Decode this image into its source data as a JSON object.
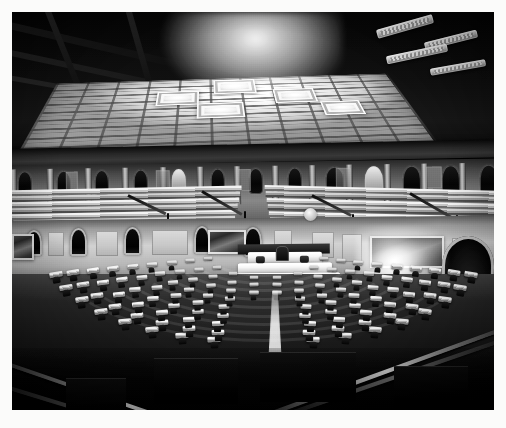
{
  "image": {
    "type": "photograph",
    "medium": "black-and-white gelatin silver print",
    "subject": "Interior of a legislative chamber (United States House of Representatives)",
    "view": "Elevated wide-angle view from the rear gallery looking toward the Speaker's rostrum",
    "orientation": "landscape",
    "border_color": "#fbfbfa",
    "caption": ""
  },
  "palette": {
    "paper_white": "#fbfbfa",
    "highlight": "#ffffff",
    "light_gray": "#d8d8d8",
    "mid_gray": "#8d8d8d",
    "dark_gray": "#3b3b3b",
    "shadow_black": "#080808"
  },
  "regions": {
    "ceiling": {
      "label": "Coffered skylight ceiling",
      "description": "Large rectangular laylight of frosted glass panels divided by a grid of mullions, with stepped recessed coffers and dark structural beams at the upper left",
      "coffer_count": 5,
      "bright_panel_count": 42,
      "tone": "brightest area of the photograph"
    },
    "light_fixtures": {
      "label": "Angled ceiling light fixtures",
      "count": 4,
      "position": "upper right, mounted on the dark ceiling plane"
    },
    "cornice": {
      "label": "Entablature and cornice band",
      "description": "Dark horizontal moulding separating the ceiling from the gallery wall"
    },
    "gallery_wall": {
      "label": "Upper gallery wall",
      "description": "Band of pilasters alternating with arched niches and flat panels running the full width of the chamber",
      "pilaster_count": 14,
      "niche_count": 13
    },
    "galleries": {
      "label": "Public galleries",
      "description": "Tiered stepped bench seating on the left and right, empty, with dark iron stair railings",
      "left_tier_count": 7,
      "right_tier_count": 8,
      "stair_rails": 4
    },
    "main_wall": {
      "label": "Lower chamber wall",
      "description": "Paneled dado with arched doorways and large framed landscape murals",
      "mural_count": 3,
      "arched_doorways": 5
    },
    "large_arch": {
      "label": "Large arched doorway",
      "position": "far right of the chamber wall",
      "tone": "deep black opening framed in white moulding"
    },
    "light_flare": {
      "label": "Lens flare / lamp burst",
      "position": "right wall, above the desks",
      "description": "Blown-out highlight where a light source overexposed the negative"
    },
    "clock": {
      "label": "Wall clock disc",
      "position": "above the rostrum, left of centre"
    },
    "rostrum": {
      "label": "Speaker's rostrum",
      "description": "Tiered white marble dais at the centre of the chamber with the Speaker's chair and clerks' desks",
      "tiers": 3,
      "chair": "Speaker's chair, dark upholstery"
    },
    "floor": {
      "label": "Chamber floor",
      "description": "Semicircular banks of members' desks arranged in concentric arcs facing the rostrum, each desk paired with a dark chair",
      "desk_arc_count": 9,
      "approximate_desk_count": 220,
      "occupancy": "empty"
    },
    "aisle": {
      "label": "Central aisle",
      "description": "Bright carpeted aisle running from the foreground up to the base of the rostrum"
    },
    "foreground": {
      "label": "Foreground gallery rail",
      "description": "Dark out-of-focus V-shaped balcony railing at the bottom of the frame, framing the view"
    }
  },
  "skylight": {
    "mullion_rows": 9,
    "mullion_cols": 11,
    "coffers": [
      {
        "name": "coffer-center-top",
        "x": 196,
        "y": 4,
        "w": 52,
        "h": 30
      },
      {
        "name": "coffer-left",
        "x": 128,
        "y": 26,
        "w": 50,
        "h": 28
      },
      {
        "name": "coffer-right",
        "x": 268,
        "y": 28,
        "w": 50,
        "h": 28
      },
      {
        "name": "coffer-mid",
        "x": 176,
        "y": 52,
        "w": 54,
        "h": 28
      },
      {
        "name": "coffer-far-right",
        "x": 320,
        "y": 56,
        "w": 46,
        "h": 26
      }
    ]
  },
  "desk_arcs": [
    {
      "name": "arc-1",
      "radius": 214,
      "desks": 18,
      "tone": "#ffffff"
    },
    {
      "name": "arc-2",
      "radius": 196,
      "desks": 18,
      "tone": "#fafafa"
    },
    {
      "name": "arc-3",
      "radius": 176,
      "desks": 16,
      "tone": "#f4f4f4"
    },
    {
      "name": "arc-4",
      "radius": 156,
      "desks": 16,
      "tone": "#efefef"
    },
    {
      "name": "arc-5",
      "radius": 136,
      "desks": 14,
      "tone": "#eaeaea"
    },
    {
      "name": "arc-6",
      "radius": 116,
      "desks": 14,
      "tone": "#e4e4e4"
    },
    {
      "name": "arc-7",
      "radius": 96,
      "desks": 12,
      "tone": "#dedede"
    },
    {
      "name": "arc-8",
      "radius": 78,
      "desks": 10,
      "tone": "#d8d8d8"
    },
    {
      "name": "arc-9",
      "radius": 60,
      "desks": 8,
      "tone": "#d2d2d2"
    }
  ]
}
